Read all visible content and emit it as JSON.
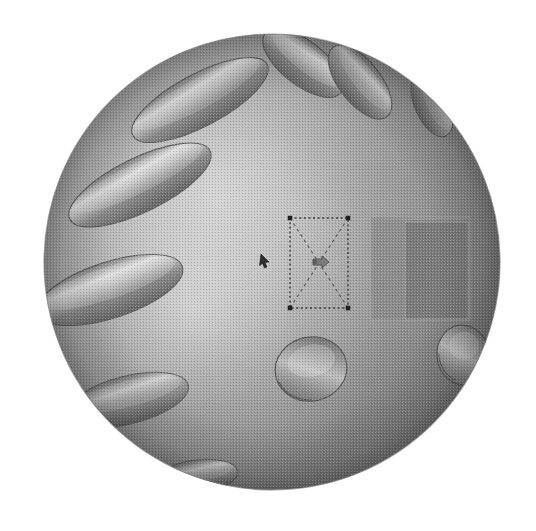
{
  "viewport": {
    "width": 536,
    "height": 531,
    "background_color": "#ffffff",
    "render_mode": "shaded-dithered",
    "label": "3D CAD Viewport"
  },
  "model": {
    "name": "perforated-sphere",
    "primitive": "sphere",
    "center_x": 272,
    "center_y": 262,
    "radius": 228,
    "base_color": "#8d8d8d",
    "highlight_color": "#d6d6d6",
    "shadow_color": "#5e5e5e",
    "outline_color": "#6b6b6b",
    "light_direction": "upper-left",
    "surface_texture": "halftone-dither"
  },
  "features": {
    "slot_label": "elongated-slot-pocket",
    "slot_color_light": "#c8c8c8",
    "slot_color_dark": "#6e6e6e",
    "slots": [
      {
        "id": "slot-1",
        "cx": 200,
        "cy": 100,
        "rx": 76,
        "ry": 26,
        "angle": -28
      },
      {
        "id": "slot-2",
        "cx": 140,
        "cy": 185,
        "rx": 78,
        "ry": 27,
        "angle": -26
      },
      {
        "id": "slot-3",
        "cx": 110,
        "cy": 290,
        "rx": 76,
        "ry": 28,
        "angle": -18
      },
      {
        "id": "slot-4",
        "cx": 128,
        "cy": 400,
        "rx": 62,
        "ry": 24,
        "angle": -14
      },
      {
        "id": "slot-5",
        "cx": 196,
        "cy": 477,
        "rx": 42,
        "ry": 17,
        "angle": -8
      },
      {
        "id": "slot-6",
        "cx": 303,
        "cy": 63,
        "rx": 48,
        "ry": 22,
        "angle": 38
      },
      {
        "id": "slot-7",
        "cx": 360,
        "cy": 82,
        "rx": 44,
        "ry": 21,
        "angle": 52
      },
      {
        "id": "slot-8",
        "cx": 432,
        "cy": 105,
        "rx": 34,
        "ry": 17,
        "angle": 66
      }
    ],
    "hole_label": "circular-through-hole",
    "hole_color_wall": "#9a9a9a",
    "hole_color_deep": "#707070",
    "holes": [
      {
        "id": "hole-1",
        "cx": 311,
        "cy": 369,
        "rx": 36,
        "ry": 32,
        "angle": -12
      },
      {
        "id": "hole-2",
        "cx": 463,
        "cy": 355,
        "rx": 26,
        "ry": 30,
        "angle": -6
      }
    ]
  },
  "selection": {
    "label": "selection-bounding-box",
    "style": "dotted",
    "color": "#3a3a3a",
    "x": 290,
    "y": 218,
    "width": 58,
    "height": 90,
    "handle_size": 4,
    "diagonals": true,
    "handle_count": 4
  },
  "cursor": {
    "label": "pointer-cursor",
    "x": 263,
    "y": 259,
    "color": "#2f2f2f"
  },
  "manipulator": {
    "label": "center-drag-handle",
    "x": 319,
    "y": 263,
    "color": "#6a6a6a"
  },
  "box_feature": {
    "label": "extruded-rectangular-boss",
    "front_face_color": "#8a8a8a",
    "side_face_color": "#7a7a7a",
    "edge_color": "#999999",
    "x": 371,
    "y": 217,
    "width": 99,
    "height": 103,
    "inner_x": 405,
    "inner_y": 222,
    "inner_width": 63,
    "inner_height": 97
  },
  "accent_colors": {
    "background": "#ffffff",
    "sphere_mid": "#8d8d8d",
    "sphere_light": "#d6d6d6",
    "sphere_dark": "#5e5e5e",
    "line": "#333333"
  }
}
